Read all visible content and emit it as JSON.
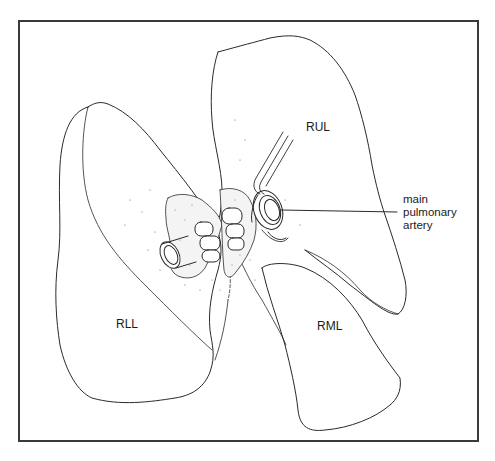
{
  "figure": {
    "type": "anatomical-illustration",
    "line_color": "#2a2a2a",
    "border_color": "#3a3a3a",
    "background": "#ffffff"
  },
  "labels": {
    "rul": "RUL",
    "rll": "RLL",
    "rml": "RML"
  },
  "callout": {
    "line1": "main",
    "line2": "pulmonary",
    "line3": "artery"
  }
}
